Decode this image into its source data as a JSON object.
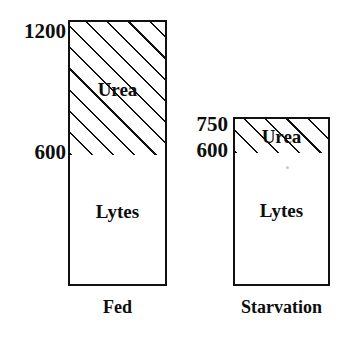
{
  "chart_data": {
    "type": "bar",
    "title": "",
    "subtitle": "",
    "xlabel": "",
    "ylabel": "",
    "stacked": true,
    "grid": false,
    "legend": "none (segments labeled in place)",
    "axis_tick_labels": [
      "1200",
      "750",
      "600"
    ],
    "ylim": [
      0,
      1200
    ],
    "categories": [
      "Fed",
      "Starvation"
    ],
    "series": [
      {
        "name": "Lytes",
        "values": [
          600,
          600
        ]
      },
      {
        "name": "Urea",
        "values": [
          600,
          150
        ]
      }
    ],
    "segment_boundaries": {
      "Fed": {
        "base": 0,
        "lytes_top": 600,
        "urea_top": 1200
      },
      "Starvation": {
        "base": 0,
        "lytes_top": 600,
        "urea_top": 750
      }
    },
    "annotations": [
      {
        "text": "1200",
        "role": "value-marker",
        "bar": "Fed",
        "level": 1200
      },
      {
        "text": "600",
        "role": "value-marker",
        "bar": "Fed",
        "level": 600
      },
      {
        "text": "750",
        "role": "value-marker",
        "bar": "Starvation",
        "level": 750
      },
      {
        "text": "600",
        "role": "value-marker",
        "bar": "Starvation",
        "level": 600
      }
    ]
  },
  "axis_markers": {
    "fed_top": "1200",
    "fed_mid": "600",
    "starvation_top": "750",
    "starvation_mid": "600"
  },
  "bars": {
    "fed": {
      "category_label": "Fed",
      "urea_label": "Urea",
      "lytes_label": "Lytes"
    },
    "starvation": {
      "category_label": "Starvation",
      "urea_label": "Urea",
      "lytes_label": "Lytes"
    }
  },
  "colors": {
    "ink": "#111111",
    "background": "#ffffff",
    "hatch": "#111111"
  }
}
